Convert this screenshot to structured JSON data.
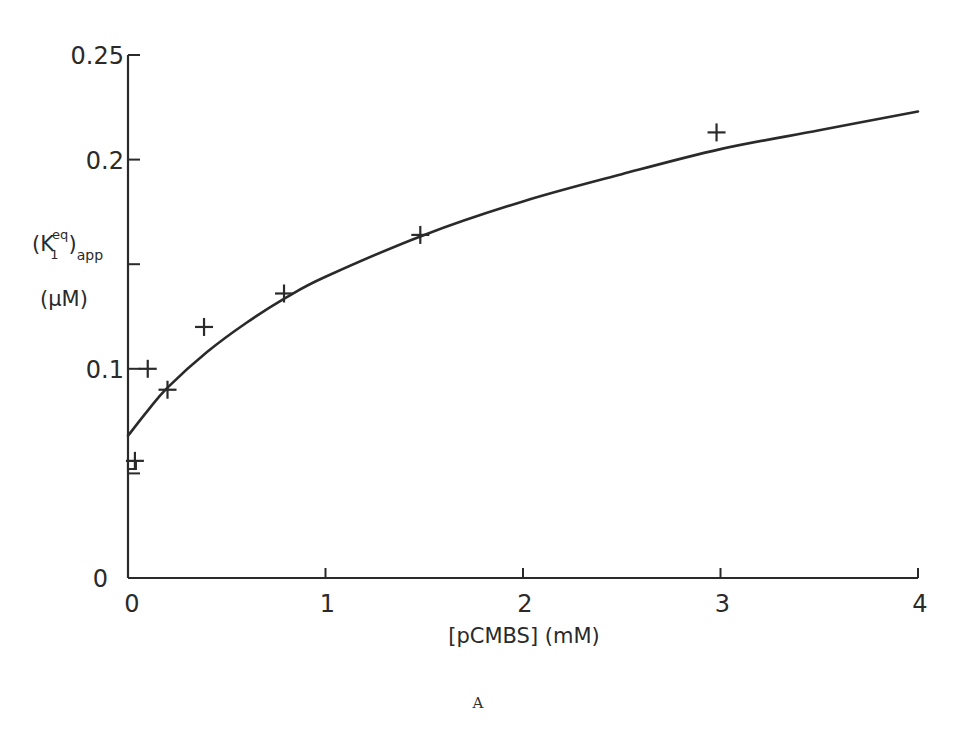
{
  "chart_data": {
    "type": "scatter",
    "title": "",
    "panel_label": "A",
    "xlabel": "[pCMBS] (mM)",
    "ylabel": "(K1eq)app (μM)",
    "ylabel_parts": {
      "symbol": "(K",
      "subscript": "1",
      "superscript": "eq",
      "close": ")",
      "suffix_sub": "app",
      "unit": "(μM)"
    },
    "xlim": [
      0,
      4
    ],
    "ylim": [
      0,
      0.25
    ],
    "xticks": [
      0,
      1,
      2,
      3,
      4
    ],
    "xtick_labels": [
      "0",
      "1",
      "2",
      "3",
      "4"
    ],
    "yticks": [
      0,
      0.05,
      0.1,
      0.15,
      0.2,
      0.25
    ],
    "ytick_labels": [
      "0",
      "",
      "0.1",
      "",
      "0.2",
      "0.25"
    ],
    "grid": false,
    "legend": null,
    "series": [
      {
        "name": "measured",
        "marker": "+",
        "x": [
          0.035,
          0.1,
          0.2,
          0.385,
          0.79,
          1.48,
          2.98
        ],
        "y": [
          0.056,
          0.1,
          0.09,
          0.12,
          0.136,
          0.164,
          0.213
        ]
      },
      {
        "name": "control",
        "marker": "open-square",
        "x": [
          0.02
        ],
        "y": [
          0.054
        ]
      },
      {
        "name": "fitted curve",
        "marker": "line",
        "x": [
          0,
          0.1,
          0.2,
          0.4,
          0.6,
          0.8,
          1.0,
          1.5,
          2.0,
          2.5,
          3.0,
          3.5,
          4.0
        ],
        "y": [
          0.068,
          0.08,
          0.091,
          0.108,
          0.122,
          0.134,
          0.144,
          0.164,
          0.18,
          0.193,
          0.205,
          0.214,
          0.223
        ]
      }
    ]
  },
  "colors": {
    "ink": "#2a2a2a",
    "background": "#ffffff"
  }
}
